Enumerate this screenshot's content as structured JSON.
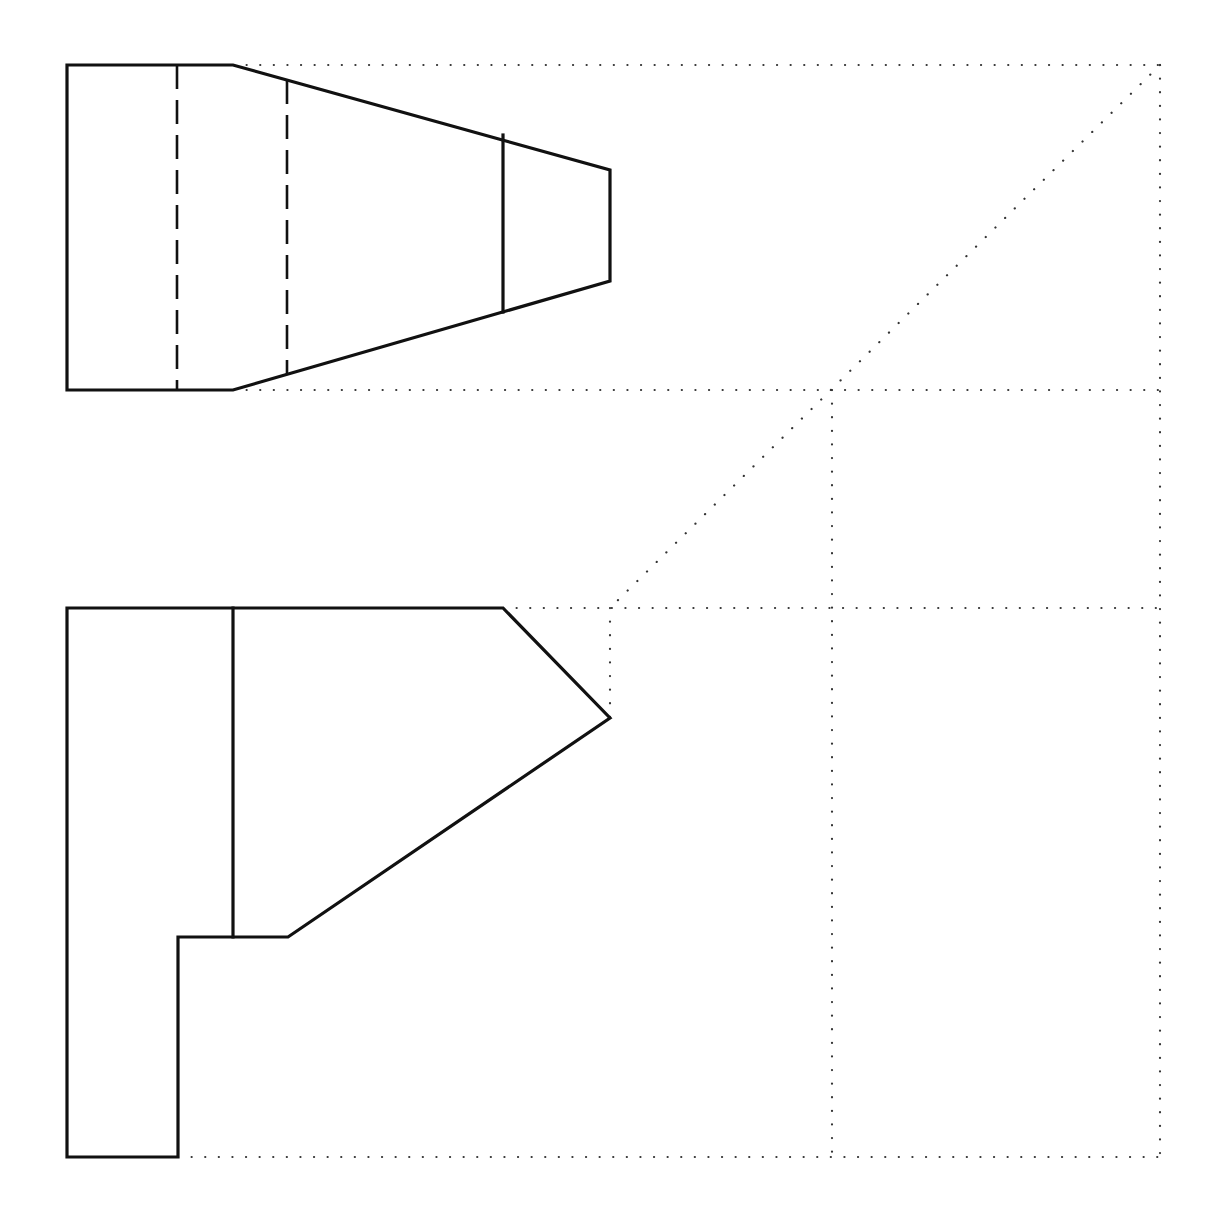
{
  "drawing": {
    "type": "orthographic-projection-exercise",
    "colors": {
      "line": "#111111",
      "construction": "#333333",
      "background": "#ffffff"
    },
    "views": {
      "top_view": {
        "outline": [
          [
            67,
            65
          ],
          [
            233,
            65
          ],
          [
            610,
            170
          ],
          [
            610,
            281
          ],
          [
            233,
            390
          ],
          [
            67,
            390
          ]
        ],
        "visible_edges": [
          {
            "x": 503,
            "y1": 135,
            "y2": 312
          }
        ],
        "hidden_edges": [
          {
            "x": 177,
            "y1": 65,
            "y2": 390
          },
          {
            "x": 287,
            "y1": 80,
            "y2": 375
          }
        ]
      },
      "front_view": {
        "outline": [
          [
            67,
            608
          ],
          [
            503,
            608
          ],
          [
            610,
            718
          ],
          [
            288,
            937
          ],
          [
            178,
            937
          ],
          [
            178,
            1157
          ],
          [
            67,
            1157
          ]
        ],
        "visible_edges": [
          {
            "x": 233,
            "y1": 608,
            "y2": 937
          }
        ]
      },
      "side_view": {
        "status": "blank"
      }
    },
    "construction_lines": {
      "horizontal": [
        {
          "y": 65,
          "x1": 233,
          "x2": 1160
        },
        {
          "y": 390,
          "x1": 233,
          "x2": 1160
        },
        {
          "y": 608,
          "x1": 503,
          "x2": 1160
        },
        {
          "y": 1157,
          "x1": 178,
          "x2": 1160
        }
      ],
      "vertical": [
        {
          "x": 1160,
          "y1": 65,
          "y2": 1157
        },
        {
          "x": 832,
          "y1": 390,
          "y2": 1157
        },
        {
          "x": 610,
          "y1": 608,
          "y2": 718
        }
      ],
      "miter_line": {
        "x1": 1160,
        "y1": 65,
        "x2": 610,
        "y2": 608,
        "angle_deg": 45
      }
    }
  }
}
